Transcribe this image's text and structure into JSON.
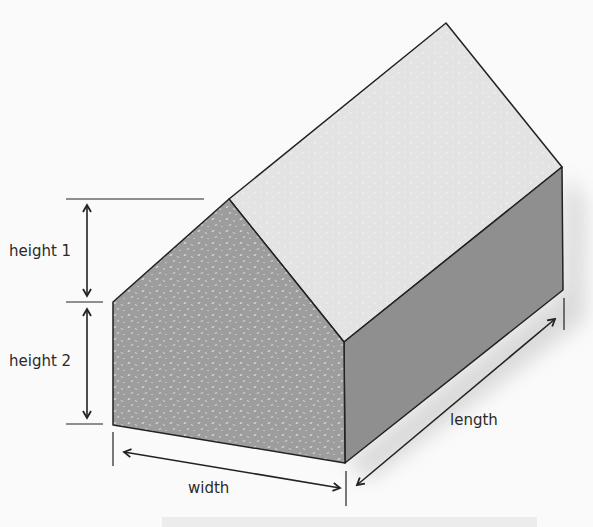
{
  "diagram": {
    "title": "",
    "labels": {
      "height1": "height 1",
      "height2": "height 2",
      "width": "width",
      "length": "length"
    },
    "colors": {
      "background": "#fafafa",
      "roof": "#e3e3e3",
      "front_face": "#9d9d9d",
      "side_face": "#8f8f8f",
      "outline": "#222222",
      "speckle": "#d8d8d8",
      "label_text": "#2a2a2a",
      "shadow": "#d9d9d9"
    },
    "dimensions": [
      {
        "name": "height 1",
        "description": "gable height from eave to roof peak"
      },
      {
        "name": "height 2",
        "description": "wall height from ground to eave"
      },
      {
        "name": "width",
        "description": "front face width"
      },
      {
        "name": "length",
        "description": "side depth of house"
      }
    ]
  }
}
